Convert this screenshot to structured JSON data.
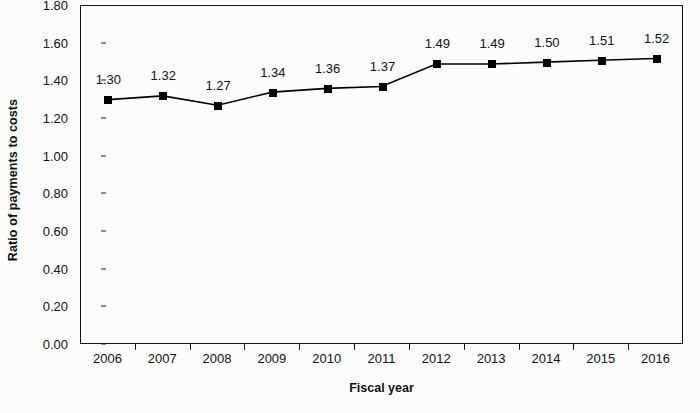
{
  "chart_data": {
    "type": "line",
    "title": "",
    "xlabel": "Fiscal year",
    "ylabel": "Ratio of payments to costs",
    "categories": [
      "2006",
      "2007",
      "2008",
      "2009",
      "2010",
      "2011",
      "2012",
      "2013",
      "2014",
      "2015",
      "2016"
    ],
    "values": [
      1.3,
      1.32,
      1.27,
      1.34,
      1.36,
      1.37,
      1.49,
      1.49,
      1.5,
      1.51,
      1.52
    ],
    "data_labels": [
      "1.30",
      "1.32",
      "1.27",
      "1.34",
      "1.36",
      "1.37",
      "1.49",
      "1.49",
      "1.50",
      "1.51",
      "1.52"
    ],
    "ylim": [
      0.0,
      1.8
    ],
    "ytick_step": 0.2,
    "ytick_labels": [
      "1.80",
      "1.60",
      "1.40",
      "1.20",
      "1.00",
      "0.80",
      "0.60",
      "0.40",
      "0.20",
      "0.00"
    ],
    "ytick_values": [
      1.8,
      1.6,
      1.4,
      1.2,
      1.0,
      0.8,
      0.6,
      0.4,
      0.2,
      0.0
    ],
    "grid": false,
    "legend": null,
    "legend_position": "none",
    "series": [
      {
        "name": "Ratio of payments to costs",
        "values": [
          1.3,
          1.32,
          1.27,
          1.34,
          1.36,
          1.37,
          1.49,
          1.49,
          1.5,
          1.51,
          1.52
        ],
        "marker": "square",
        "marker_color": "#000000",
        "line_color": "#000000"
      }
    ],
    "colors": {
      "line": "#000000",
      "marker": "#000000",
      "axis": "#151515",
      "text": "#111111",
      "background": "#fcfcfc"
    }
  }
}
